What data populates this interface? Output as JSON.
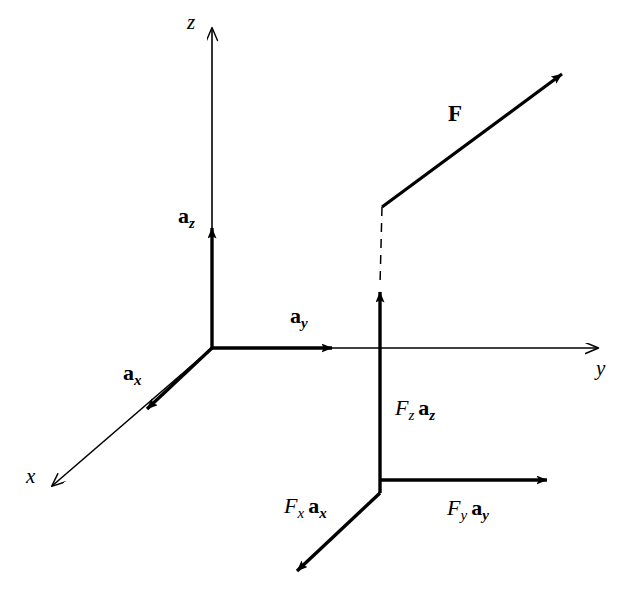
{
  "figure": {
    "type": "vector-diagram",
    "title": "",
    "background_color": "#ffffff",
    "stroke_color": "#000000",
    "width": 640,
    "height": 609
  },
  "axes": {
    "origin": {
      "x": 212,
      "y": 348
    },
    "items": [
      {
        "name": "x",
        "label": "x",
        "label_x": 26,
        "label_y": 466,
        "tip": {
          "x": 45,
          "y": 492
        },
        "arrowhead": "open"
      },
      {
        "name": "y",
        "label": "y",
        "label_x": 596,
        "label_y": 358,
        "tip": {
          "x": 610,
          "y": 348
        },
        "arrowhead": "open"
      },
      {
        "name": "z",
        "label": "z",
        "label_x": 187,
        "label_y": 12,
        "tip": {
          "x": 212,
          "y": 22
        },
        "arrowhead": "open"
      }
    ]
  },
  "unit_vectors": [
    {
      "name": "a-x",
      "symbol": "a",
      "subscript": "x",
      "label_x": 123,
      "label_y": 362,
      "tip": {
        "x": 140,
        "y": 416
      }
    },
    {
      "name": "a-y",
      "symbol": "a",
      "subscript": "y",
      "label_x": 290,
      "label_y": 305,
      "tip": {
        "x": 340,
        "y": 348
      }
    },
    {
      "name": "a-z",
      "symbol": "a",
      "subscript": "z",
      "label_x": 178,
      "label_y": 205,
      "tip": {
        "x": 212,
        "y": 222
      }
    }
  ],
  "force": {
    "name": "resultant-force",
    "label": "F",
    "label_x": 448,
    "label_y": 102,
    "tail": {
      "x": 382,
      "y": 207
    },
    "tip": {
      "x": 570,
      "y": 68
    }
  },
  "components": [
    {
      "name": "force-x-component",
      "scalar": "F",
      "scalar_sub": "x",
      "unit": "a",
      "unit_sub": "x",
      "label_x": 284,
      "label_y": 495,
      "tail": {
        "x": 380,
        "y": 493
      },
      "tip": {
        "x": 290,
        "y": 578
      }
    },
    {
      "name": "force-y-component",
      "scalar": "F",
      "scalar_sub": "y",
      "unit": "a",
      "unit_sub": "y",
      "label_x": 447,
      "label_y": 497,
      "tail": {
        "x": 380,
        "y": 480
      },
      "tip": {
        "x": 555,
        "y": 480
      }
    },
    {
      "name": "force-z-component",
      "scalar": "F",
      "scalar_sub": "z",
      "unit": "a",
      "unit_sub": "z",
      "label_x": 395,
      "label_y": 397,
      "tail": {
        "x": 380,
        "y": 493
      },
      "tip": {
        "x": 380,
        "y": 285
      }
    }
  ],
  "projection_line": {
    "name": "dashed-projection",
    "style": "dashed",
    "from": {
      "x": 382,
      "y": 207
    },
    "to": {
      "x": 380,
      "y": 285
    }
  }
}
